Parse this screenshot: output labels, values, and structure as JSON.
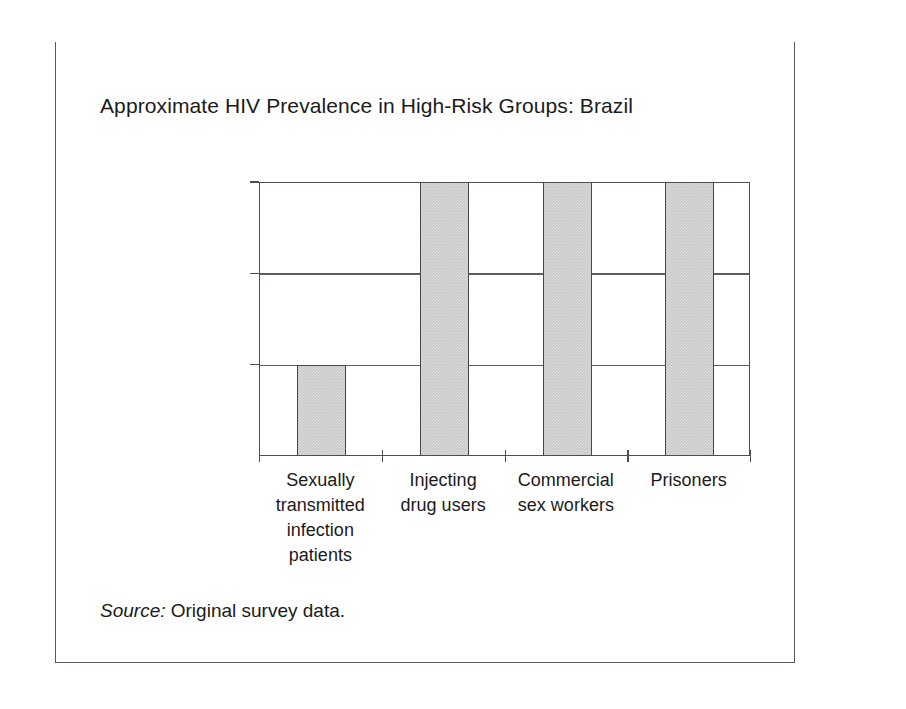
{
  "figure": {
    "title": "Approximate HIV Prevalence in High-Risk Groups: Brazil",
    "source_label": "Source:",
    "source_text": "Original survey data."
  },
  "colors": {
    "bar_fill": "#c8c8c8",
    "bar_outline": "#43484c",
    "axis": "#4a4f53",
    "gridline": "#5a5f63",
    "frame_rule": "#111111",
    "frame_border": "#555a5e",
    "text": "#1b1b1b"
  },
  "chart_data": {
    "type": "bar",
    "title": "Approximate HIV Prevalence in High-Risk Groups: Brazil",
    "xlabel": "",
    "ylabel": "",
    "categories": [
      "Sexually transmitted infection patients",
      "Injecting drug users",
      "Commercial sex workers",
      "Prisoners"
    ],
    "category_lines": [
      [
        "Sexually",
        "transmitted",
        "infection",
        "patients"
      ],
      [
        "Injecting",
        "drug users"
      ],
      [
        "Commercial",
        "sex workers"
      ],
      [
        "Prisoners"
      ]
    ],
    "ytick_labels": [
      "<5%",
      "5%–10%",
      ">10%"
    ],
    "ytick_levels": [
      1,
      2,
      3
    ],
    "ylim": [
      0,
      3
    ],
    "values": [
      1,
      3,
      3,
      3
    ],
    "value_labels": [
      "<5%",
      ">10%",
      ">10%",
      ">10%"
    ],
    "grid": true,
    "legend": "none",
    "annotations": []
  }
}
